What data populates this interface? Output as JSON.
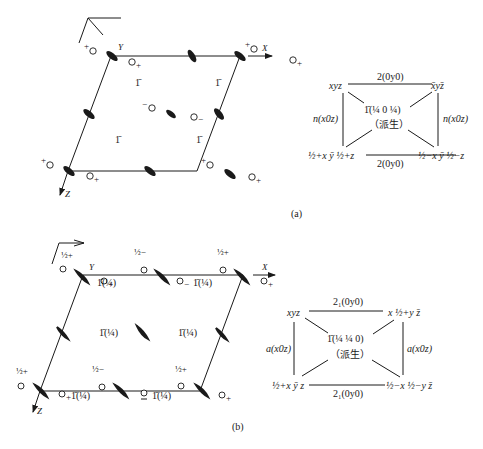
{
  "figure": {
    "panel_a": {
      "caption": "(a)",
      "axes": {
        "x": "X",
        "y": "Y",
        "z": "Z"
      },
      "inversion_label": "1̄",
      "positions": {
        "plus": "+",
        "minus": "−"
      },
      "table": {
        "top_left": "xyz",
        "top_right": "x̄yz̄",
        "bottom_left": "½+x ȳ ½+z",
        "bottom_right": "½−x ȳ ½−z",
        "top_edge": "2(0y0)",
        "bottom_edge": "2(0y0)",
        "left_edge": "n(x0z)",
        "right_edge": "n(x0z)",
        "center_line1": "1̄(¼ 0 ¼)",
        "center_line2": "（派生）"
      }
    },
    "panel_b": {
      "caption": "(b)",
      "axes": {
        "x": "X",
        "y": "Y",
        "z": "Z"
      },
      "inversion_label": "1̄(¼)",
      "height_plus": "½+",
      "height_minus": "½−",
      "table": {
        "top_left": "xyz",
        "top_right": "x ½+y z̄",
        "bottom_left": "½+x ȳ z",
        "bottom_right": "½−x ½−y z̄",
        "top_edge": "2₁(0y0)",
        "bottom_edge": "2₁(0y0)",
        "left_edge": "a(x0z)",
        "right_edge": "a(x0z)",
        "center_line1": "1̄(¼ ¼ 0)",
        "center_line2": "（派生）"
      }
    }
  }
}
